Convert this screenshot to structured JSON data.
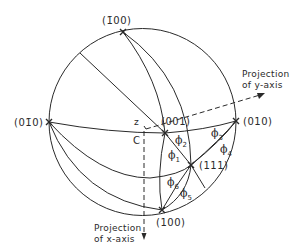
{
  "figure": {
    "type": "stereographic projection",
    "poles": {
      "bar100": "(1̄00)",
      "bar010": "(01̄0)",
      "p010": "(010)",
      "p001": "(001)",
      "p111": "(111)",
      "p100": "(100)"
    },
    "axes": {
      "y_line1": "Projection",
      "y_line2": "of y-axis",
      "x_line1": "Projection",
      "x_line2": "of x-axis",
      "z_label": "z",
      "center_label": "C"
    },
    "angles": {
      "phi1": "1",
      "phi2": "2",
      "phi3": "3",
      "phi4": "4",
      "phi5": "5",
      "phi6": "6",
      "phi_symbol": "ϕ"
    },
    "colors": {
      "line": "#2a2a2a",
      "background": "#ffffff"
    }
  }
}
